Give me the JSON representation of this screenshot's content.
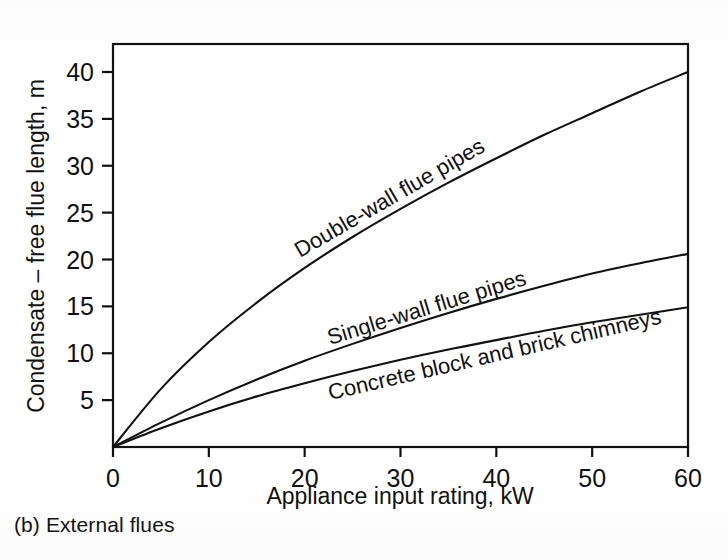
{
  "figure": {
    "caption": "(b) External flues"
  },
  "chart_data": {
    "type": "line",
    "title": "",
    "subtitle": "",
    "xlabel": "Appliance input rating, kW",
    "ylabel": "Condensate – free flue length, m",
    "xlim": [
      0,
      60
    ],
    "ylim": [
      0,
      42.5
    ],
    "xticks": [
      0,
      10,
      20,
      30,
      40,
      50,
      60
    ],
    "xticklabels": [
      "0",
      "10",
      "20",
      "30",
      "40",
      "50",
      "60"
    ],
    "yticks": [
      5,
      10,
      15,
      20,
      25,
      30,
      35,
      40
    ],
    "yticklabels": [
      "5",
      "10",
      "15",
      "20",
      "25",
      "30",
      "35",
      "40"
    ],
    "grid": false,
    "legend": "inline-curve-labels",
    "frame": "box",
    "x": [
      0,
      5,
      10,
      15,
      20,
      25,
      30,
      35,
      40,
      45,
      50,
      55,
      60
    ],
    "series": [
      {
        "name": "Double-wall flue pipes",
        "label": "Double-wall flue pipes",
        "label_rotation_deg": -30,
        "values": [
          0.0,
          6.2,
          11.2,
          15.4,
          19.1,
          22.4,
          25.4,
          28.2,
          30.8,
          33.3,
          35.6,
          37.9,
          40.0
        ],
        "value_at_60": 40.0,
        "color": "#111111"
      },
      {
        "name": "Single-wall flue pipes",
        "label": "Single-wall flue pipes",
        "label_rotation_deg": -17,
        "values": [
          0.0,
          2.6,
          5.0,
          7.2,
          9.2,
          11.0,
          12.7,
          14.3,
          15.8,
          17.2,
          18.5,
          19.6,
          20.6
        ],
        "value_at_60": 20.6,
        "color": "#111111"
      },
      {
        "name": "Concrete block and brick chimneys",
        "label": "Concrete block and brick chimneys",
        "label_rotation_deg": -13,
        "values": [
          0.0,
          2.0,
          3.8,
          5.4,
          6.8,
          8.1,
          9.3,
          10.4,
          11.4,
          12.4,
          13.3,
          14.1,
          14.9
        ],
        "value_at_60": 14.9,
        "color": "#111111"
      }
    ]
  }
}
